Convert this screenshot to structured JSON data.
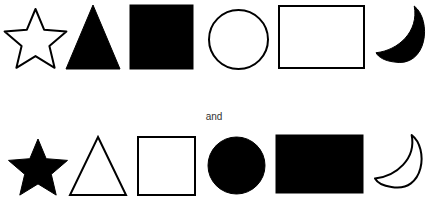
{
  "connector_text": "and",
  "colors": {
    "ink": "#000000",
    "paper": "#ffffff"
  },
  "rows": [
    {
      "name": "top-row",
      "shapes": [
        {
          "shape": "star",
          "fill": "outline"
        },
        {
          "shape": "triangle",
          "fill": "solid"
        },
        {
          "shape": "square",
          "fill": "solid"
        },
        {
          "shape": "circle",
          "fill": "outline"
        },
        {
          "shape": "rectangle",
          "fill": "outline"
        },
        {
          "shape": "crescent-moon",
          "fill": "solid"
        }
      ]
    },
    {
      "name": "bottom-row",
      "shapes": [
        {
          "shape": "star",
          "fill": "solid"
        },
        {
          "shape": "triangle",
          "fill": "outline"
        },
        {
          "shape": "square",
          "fill": "outline"
        },
        {
          "shape": "circle",
          "fill": "solid"
        },
        {
          "shape": "rectangle",
          "fill": "solid"
        },
        {
          "shape": "crescent-moon",
          "fill": "outline"
        }
      ]
    }
  ]
}
